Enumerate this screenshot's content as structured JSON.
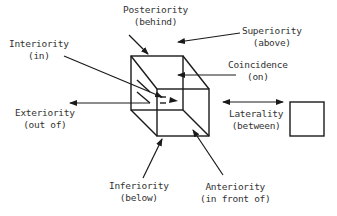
{
  "diagram": {
    "type": "spatial-relations",
    "stroke_color": "#1a1a1a",
    "labels": {
      "posteriority": {
        "term": "Posteriority",
        "gloss": "(behind)"
      },
      "superiority": {
        "term": "Superiority",
        "gloss": "(above)"
      },
      "interiority": {
        "term": "Interiority",
        "gloss": "(in)"
      },
      "coincidence": {
        "term": "Coincidence",
        "gloss": "(on)"
      },
      "exteriority": {
        "term": "Exteriority",
        "gloss": "(out of)"
      },
      "laterality": {
        "term": "Laterality",
        "gloss": "(between)"
      },
      "inferiority": {
        "term": "Inferiority",
        "gloss": "(below)"
      },
      "anteriority": {
        "term": "Anteriority",
        "gloss": "(in front of)"
      }
    }
  }
}
